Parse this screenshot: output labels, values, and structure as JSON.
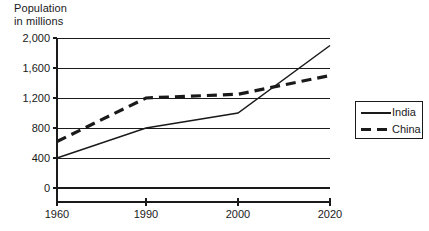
{
  "axis_title": "Population\nin millions",
  "caption": "",
  "legend": {
    "entries": [
      {
        "label": "India",
        "style": "solid",
        "swatch_name": "legend-swatch-india"
      },
      {
        "label": "China",
        "style": "dashed",
        "swatch_name": "legend-swatch-china"
      }
    ]
  },
  "colors": {
    "line": "#1a1a1a",
    "grid": "#1a1a1a",
    "background": "#ffffff"
  },
  "chart_data": {
    "type": "line",
    "title": "",
    "subtitle": "",
    "xlabel": "",
    "ylabel": "Population in millions",
    "x": [
      1960,
      1990,
      2000,
      2020
    ],
    "categories": [
      "1960",
      "1990",
      "2000",
      "2020"
    ],
    "xticklabels": [
      "1960",
      "1990",
      "2000",
      "2020"
    ],
    "yticklabels": [
      "0",
      "400",
      "800",
      "1,200",
      "1,600",
      "2,000"
    ],
    "yticks": [
      0,
      400,
      800,
      1200,
      1600,
      2000
    ],
    "ylim": [
      0,
      2000
    ],
    "grid": "horizontal",
    "legend_position": "right",
    "series": [
      {
        "name": "India",
        "style": "solid",
        "values": [
          400,
          800,
          1000,
          1900
        ]
      },
      {
        "name": "China",
        "style": "dashed",
        "values": [
          620,
          1200,
          1250,
          1500
        ]
      }
    ],
    "annotations": []
  }
}
